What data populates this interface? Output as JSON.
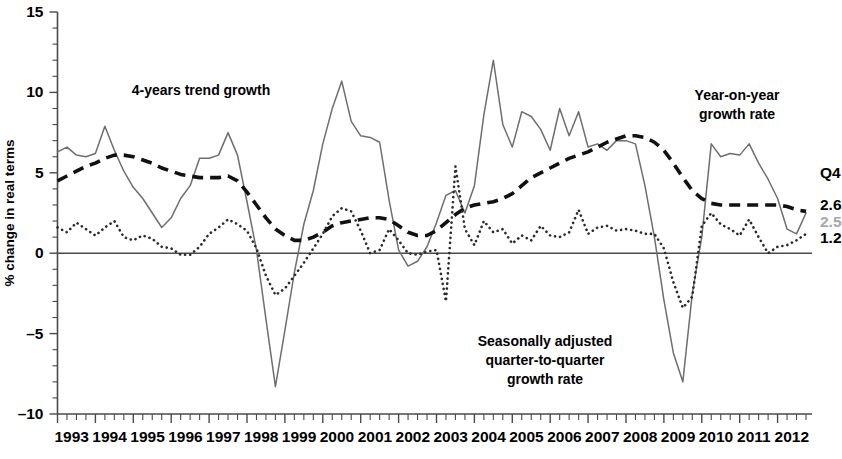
{
  "chart_data": {
    "type": "line",
    "title": "",
    "xlabel": "",
    "ylabel": "% change in real terms",
    "ylim": [
      -10,
      15
    ],
    "xlim": [
      1993.0,
      2012.75
    ],
    "yticks": [
      15,
      10,
      5,
      0,
      -5,
      -10
    ],
    "ytick_labels": [
      "15",
      "10",
      "5",
      "0",
      "–5",
      "–10"
    ],
    "grid": false,
    "legend_position": "inline-annotations",
    "x_tick_interval_quarters": 1,
    "categories": [
      "1993Q1",
      "1993Q2",
      "1993Q3",
      "1993Q4",
      "1994Q1",
      "1994Q2",
      "1994Q3",
      "1994Q4",
      "1995Q1",
      "1995Q2",
      "1995Q3",
      "1995Q4",
      "1996Q1",
      "1996Q2",
      "1996Q3",
      "1996Q4",
      "1997Q1",
      "1997Q2",
      "1997Q3",
      "1997Q4",
      "1998Q1",
      "1998Q2",
      "1998Q3",
      "1998Q4",
      "1999Q1",
      "1999Q2",
      "1999Q3",
      "1999Q4",
      "2000Q1",
      "2000Q2",
      "2000Q3",
      "2000Q4",
      "2001Q1",
      "2001Q2",
      "2001Q3",
      "2001Q4",
      "2002Q1",
      "2002Q2",
      "2002Q3",
      "2002Q4",
      "2003Q1",
      "2003Q2",
      "2003Q3",
      "2003Q4",
      "2004Q1",
      "2004Q2",
      "2004Q3",
      "2004Q4",
      "2005Q1",
      "2005Q2",
      "2005Q3",
      "2005Q4",
      "2006Q1",
      "2006Q2",
      "2006Q3",
      "2006Q4",
      "2007Q1",
      "2007Q2",
      "2007Q3",
      "2007Q4",
      "2008Q1",
      "2008Q2",
      "2008Q3",
      "2008Q4",
      "2009Q1",
      "2009Q2",
      "2009Q3",
      "2009Q4",
      "2010Q1",
      "2010Q2",
      "2010Q3",
      "2010Q4",
      "2011Q1",
      "2011Q2",
      "2011Q3",
      "2011Q4",
      "2012Q1",
      "2012Q2",
      "2012Q3",
      "2012Q4"
    ],
    "xtick_labels": [
      "1993",
      "1994",
      "1995",
      "1996",
      "1997",
      "1998",
      "1999",
      "2000",
      "2001",
      "2002",
      "2003",
      "2004",
      "2005",
      "2006",
      "2007",
      "2008",
      "2009",
      "2010",
      "2011",
      "2012"
    ],
    "series": [
      {
        "name": "Year-on-year growth rate",
        "style": "solid",
        "color": "#6e6e6e",
        "end_value": 2.5,
        "values": [
          6.3,
          6.6,
          6.1,
          6.0,
          6.2,
          7.9,
          6.4,
          5.1,
          4.1,
          3.4,
          2.5,
          1.6,
          2.2,
          3.4,
          4.2,
          5.9,
          5.9,
          6.1,
          7.5,
          6.1,
          3.2,
          0.2,
          -4.1,
          -8.3,
          -4.8,
          -1.2,
          1.8,
          3.9,
          6.8,
          9.0,
          10.7,
          8.2,
          7.3,
          7.2,
          6.9,
          3.3,
          0.2,
          -0.8,
          -0.5,
          0.4,
          1.9,
          3.6,
          3.9,
          2.5,
          4.2,
          8.6,
          12.0,
          8.0,
          6.6,
          8.8,
          8.5,
          7.7,
          6.4,
          9.0,
          7.3,
          8.8,
          6.6,
          6.8,
          6.4,
          7.0,
          7.0,
          6.8,
          4.2,
          1.0,
          -2.9,
          -6.2,
          -8.0,
          -2.5,
          1.0,
          6.8,
          6.0,
          6.2,
          6.1,
          6.8,
          5.6,
          4.6,
          3.4,
          1.5,
          1.2,
          2.5
        ]
      },
      {
        "name": "4-years trend growth",
        "style": "dashed",
        "color": "#111111",
        "end_value": 2.6,
        "values": [
          4.5,
          4.8,
          5.1,
          5.4,
          5.6,
          5.9,
          6.1,
          6.1,
          6.0,
          5.8,
          5.6,
          5.3,
          5.1,
          4.9,
          4.8,
          4.7,
          4.7,
          4.7,
          4.8,
          4.5,
          3.8,
          3.0,
          2.2,
          1.5,
          1.1,
          0.8,
          0.8,
          1.0,
          1.3,
          1.7,
          1.9,
          2.0,
          2.1,
          2.2,
          2.2,
          2.1,
          1.7,
          1.3,
          1.1,
          1.1,
          1.4,
          1.9,
          2.4,
          2.8,
          3.0,
          3.1,
          3.2,
          3.4,
          3.7,
          4.2,
          4.7,
          5.0,
          5.3,
          5.6,
          5.9,
          6.1,
          6.3,
          6.6,
          6.9,
          7.1,
          7.3,
          7.3,
          7.2,
          6.9,
          6.4,
          5.6,
          4.7,
          3.9,
          3.4,
          3.1,
          3.0,
          3.0,
          3.0,
          3.0,
          3.0,
          3.0,
          3.0,
          2.9,
          2.7,
          2.6
        ]
      },
      {
        "name": "Seasonally adjusted quarter-to-quarter growth rate",
        "style": "dotted",
        "color": "#2b2b2b",
        "end_value": 1.2,
        "values": [
          1.6,
          1.3,
          1.9,
          1.5,
          1.1,
          1.6,
          2.0,
          1.0,
          0.8,
          1.1,
          0.9,
          0.4,
          0.3,
          -0.1,
          -0.1,
          0.4,
          1.2,
          1.6,
          2.1,
          1.8,
          1.4,
          0.3,
          -1.4,
          -2.6,
          -2.2,
          -1.4,
          -0.6,
          0.3,
          1.2,
          2.3,
          2.8,
          2.6,
          1.4,
          0.0,
          0.2,
          1.5,
          0.8,
          0.0,
          -0.1,
          0.1,
          0.2,
          -3.0,
          5.4,
          1.5,
          0.5,
          2.0,
          1.3,
          1.5,
          0.6,
          1.1,
          0.8,
          1.7,
          1.1,
          1.0,
          1.3,
          2.7,
          1.2,
          1.6,
          1.7,
          1.4,
          1.5,
          1.4,
          1.2,
          1.2,
          0.3,
          -1.8,
          -3.4,
          -2.7,
          1.7,
          2.5,
          1.8,
          1.5,
          1.1,
          2.1,
          1.0,
          0.0,
          0.4,
          0.5,
          0.8,
          1.2
        ]
      }
    ],
    "annotations": [
      {
        "id": "annot-trend",
        "text": "4-years trend growth",
        "x_px": 201,
        "y_px": 95
      },
      {
        "id": "annot-yoy-line1",
        "text": "Year-on-year",
        "x_px": 737,
        "y_px": 100
      },
      {
        "id": "annot-yoy-line2",
        "text": "growth rate",
        "x_px": 737,
        "y_px": 119
      },
      {
        "id": "annot-qtq-line1",
        "text": "Seasonally adjusted",
        "x_px": 545,
        "y_px": 346
      },
      {
        "id": "annot-qtq-line2",
        "text": "quarter-to-quarter",
        "x_px": 545,
        "y_px": 365
      },
      {
        "id": "annot-qtq-line3",
        "text": "growth rate",
        "x_px": 545,
        "y_px": 384
      }
    ],
    "end_labels": {
      "period": "Q4",
      "period_y_px": 178,
      "values": [
        {
          "id": "end-value-trend",
          "text": "2.6",
          "color": "#111111",
          "y_px": 210
        },
        {
          "id": "end-value-yoy",
          "text": "2.5",
          "color": "#a8a8a8",
          "y_px": 227
        },
        {
          "id": "end-value-qtq",
          "text": "1.2",
          "color": "#111111",
          "y_px": 243
        }
      ]
    }
  }
}
